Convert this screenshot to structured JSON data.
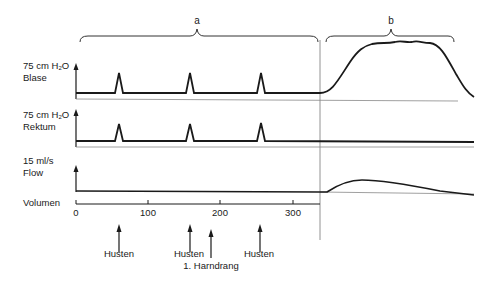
{
  "braces": {
    "a": {
      "label": "a"
    },
    "b": {
      "label": "b"
    }
  },
  "channels": {
    "blase": {
      "scale": "75 cm H",
      "unit_sub": "2",
      "unit_tail": "O",
      "name": "Blase"
    },
    "rektum": {
      "scale": "75 cm H",
      "unit_sub": "2",
      "unit_tail": "O",
      "name": "Rektum"
    },
    "flow": {
      "scale": "15 ml/s",
      "name": "Flow"
    }
  },
  "volume_axis": {
    "label": "Volumen",
    "ticks": [
      "0",
      "100",
      "200",
      "300"
    ]
  },
  "annotations": {
    "cough1": "Husten",
    "cough2": "Husten",
    "urge": "1. Harndrang",
    "cough3": "Husten"
  },
  "colors": {
    "trace": "#1a1a1a",
    "axis": "#555555",
    "divider": "#777777"
  }
}
